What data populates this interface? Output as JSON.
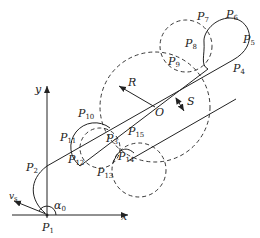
{
  "axes": {
    "x_label": "x",
    "y_label": "y"
  },
  "angle_label": {
    "symbol": "α",
    "sub": "0"
  },
  "velocity_label": {
    "symbol": "v",
    "sub": "s"
  },
  "radius_label": "R",
  "center_label": "O",
  "spacing_label": "S",
  "points": [
    {
      "symbol": "P",
      "sub": "1"
    },
    {
      "symbol": "P",
      "sub": "2"
    },
    {
      "symbol": "P",
      "sub": "3"
    },
    {
      "symbol": "P",
      "sub": "4"
    },
    {
      "symbol": "P",
      "sub": "5"
    },
    {
      "symbol": "P",
      "sub": "6"
    },
    {
      "symbol": "P",
      "sub": "7"
    },
    {
      "symbol": "P",
      "sub": "8"
    },
    {
      "symbol": "P",
      "sub": "9"
    },
    {
      "symbol": "P",
      "sub": "10"
    },
    {
      "symbol": "P",
      "sub": "11"
    },
    {
      "symbol": "P",
      "sub": "12"
    },
    {
      "symbol": "P",
      "sub": "13"
    },
    {
      "symbol": "P",
      "sub": "14"
    },
    {
      "symbol": "P",
      "sub": "15"
    }
  ]
}
